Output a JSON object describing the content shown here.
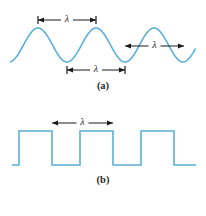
{
  "figure": {
    "background_color": "#ffffff",
    "wave_color": "#5bafd8",
    "annotation_color": "#1a1a1a",
    "label_color": "#2b2b2b"
  },
  "panels": [
    {
      "id": "panel-a",
      "label": "(a)",
      "waveform_type": "sine",
      "description": "Sinusoidal wave with three wavelength measurements",
      "wave": {
        "color": "#5bafd8",
        "stroke_width": 1.6,
        "peaks_x": [
          38,
          96,
          155
        ],
        "troughs_x": [
          67,
          125
        ],
        "peak_y": 28,
        "trough_y": 62,
        "baseline_y": 45,
        "start_x": 10,
        "end_x": 196
      },
      "measurements": [
        {
          "name": "peak-to-peak-top",
          "symbol": "λ",
          "from_x": 38,
          "to_x": 96,
          "y": 20,
          "endcaps": "tick",
          "label_position": "middle"
        },
        {
          "name": "trough-to-trough-bottom",
          "symbol": "λ",
          "from_x": 67,
          "to_x": 125,
          "y": 70,
          "endcaps": "tick",
          "label_position": "middle"
        },
        {
          "name": "trough-to-peak-right",
          "symbol": "λ",
          "from_x": 125,
          "to_x": 184,
          "y": 46,
          "endcaps": "none",
          "label_position": "middle"
        }
      ]
    },
    {
      "id": "panel-b",
      "label": "(b)",
      "waveform_type": "square",
      "description": "Square wave with one wavelength measurement",
      "wave": {
        "color": "#5bafd8",
        "stroke_width": 1.6,
        "high_y": 131,
        "low_y": 165,
        "start_x": 12,
        "end_x": 196,
        "rising_edges_x": [
          19,
          80,
          141
        ],
        "falling_edges_x": [
          52,
          113,
          174
        ]
      },
      "measurements": [
        {
          "name": "edge-to-edge",
          "symbol": "λ",
          "from_x": 52,
          "to_x": 113,
          "y": 123,
          "endcaps": "none",
          "label_position": "middle"
        }
      ]
    }
  ],
  "labels": {
    "panel_a_caption": "(a)",
    "panel_b_caption": "(b)",
    "lambda_symbol": "λ"
  }
}
